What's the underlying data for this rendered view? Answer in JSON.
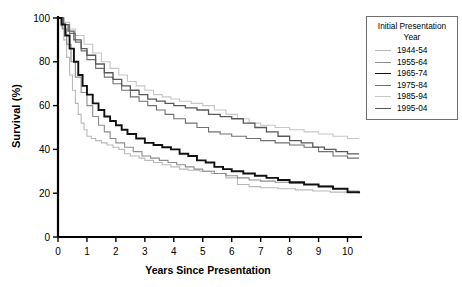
{
  "chart_data": {
    "type": "line",
    "title": "",
    "xlabel": "Years Since Presentation",
    "ylabel": "Survival (%)",
    "xlim": [
      0,
      10.5
    ],
    "ylim": [
      0,
      100
    ],
    "xticks": [
      "0",
      "1",
      "2",
      "3",
      "4",
      "5",
      "6",
      "7",
      "8",
      "9",
      "10"
    ],
    "yticks": [
      "0",
      "20",
      "40",
      "60",
      "80",
      "100"
    ],
    "grid": false,
    "legend_position": "right-outside",
    "legend_title": "Initial Presentation Year",
    "series": [
      {
        "name": "1944-54",
        "color": "#b9b9b9",
        "width": 1.1,
        "final_value": 27,
        "points": [
          [
            0,
            100
          ],
          [
            0.12,
            96
          ],
          [
            0.2,
            90
          ],
          [
            0.3,
            82
          ],
          [
            0.4,
            74
          ],
          [
            0.5,
            67
          ],
          [
            0.6,
            61
          ],
          [
            0.7,
            56
          ],
          [
            0.8,
            52
          ],
          [
            0.9,
            49
          ],
          [
            1.0,
            46
          ],
          [
            1.15,
            45
          ],
          [
            1.3,
            44
          ],
          [
            1.5,
            43
          ],
          [
            1.7,
            42
          ],
          [
            1.9,
            41
          ],
          [
            2.1,
            40
          ],
          [
            2.3,
            38
          ],
          [
            2.5,
            37
          ],
          [
            2.8,
            36
          ],
          [
            3.0,
            35
          ],
          [
            3.3,
            34
          ],
          [
            3.6,
            33
          ],
          [
            3.9,
            32
          ],
          [
            4.2,
            31
          ],
          [
            4.5,
            30.5
          ],
          [
            4.9,
            30
          ],
          [
            5.3,
            29
          ],
          [
            5.8,
            27
          ],
          [
            6.2,
            24
          ],
          [
            6.6,
            23
          ],
          [
            7.0,
            22.5
          ],
          [
            7.6,
            22
          ],
          [
            8.2,
            21.5
          ],
          [
            8.8,
            21
          ],
          [
            9.4,
            20.5
          ],
          [
            10.0,
            20
          ],
          [
            10.4,
            20
          ]
        ]
      },
      {
        "name": "1955-64",
        "color": "#8c8c8c",
        "width": 1.1,
        "final_value": 21,
        "points": [
          [
            0,
            100
          ],
          [
            0.15,
            95
          ],
          [
            0.3,
            88
          ],
          [
            0.45,
            80
          ],
          [
            0.6,
            73
          ],
          [
            0.8,
            66
          ],
          [
            1.0,
            60
          ],
          [
            1.2,
            55
          ],
          [
            1.4,
            51
          ],
          [
            1.6,
            48
          ],
          [
            1.8,
            45
          ],
          [
            2.0,
            43
          ],
          [
            2.3,
            41
          ],
          [
            2.6,
            39
          ],
          [
            2.9,
            37
          ],
          [
            3.2,
            36
          ],
          [
            3.5,
            35
          ],
          [
            3.8,
            34
          ],
          [
            4.1,
            33
          ],
          [
            4.4,
            32
          ],
          [
            4.7,
            31
          ],
          [
            5.0,
            30
          ],
          [
            5.4,
            29
          ],
          [
            5.8,
            28
          ],
          [
            6.2,
            27
          ],
          [
            6.6,
            26
          ],
          [
            7.0,
            25.5
          ],
          [
            7.5,
            25
          ],
          [
            8.0,
            24.5
          ],
          [
            8.5,
            24
          ],
          [
            9.0,
            23.5
          ],
          [
            9.5,
            22
          ],
          [
            10.0,
            21
          ],
          [
            10.4,
            21
          ]
        ]
      },
      {
        "name": "1965-74",
        "color": "#111111",
        "width": 1.9,
        "final_value": 20,
        "points": [
          [
            0,
            100
          ],
          [
            0.12,
            97
          ],
          [
            0.25,
            92
          ],
          [
            0.4,
            86
          ],
          [
            0.55,
            80
          ],
          [
            0.7,
            74
          ],
          [
            0.85,
            69
          ],
          [
            1.0,
            65
          ],
          [
            1.2,
            61
          ],
          [
            1.4,
            58
          ],
          [
            1.6,
            55
          ],
          [
            1.8,
            53
          ],
          [
            2.0,
            51
          ],
          [
            2.2,
            49
          ],
          [
            2.4,
            47
          ],
          [
            2.7,
            45
          ],
          [
            3.0,
            43
          ],
          [
            3.3,
            42
          ],
          [
            3.6,
            41
          ],
          [
            3.9,
            40
          ],
          [
            4.2,
            38
          ],
          [
            4.5,
            37
          ],
          [
            4.8,
            35
          ],
          [
            5.1,
            34
          ],
          [
            5.4,
            32
          ],
          [
            5.7,
            31
          ],
          [
            6.0,
            30
          ],
          [
            6.4,
            29
          ],
          [
            6.8,
            28
          ],
          [
            7.2,
            27
          ],
          [
            7.6,
            26
          ],
          [
            8.0,
            25
          ],
          [
            8.5,
            24
          ],
          [
            9.0,
            23
          ],
          [
            9.5,
            22
          ],
          [
            10.0,
            20.5
          ],
          [
            10.4,
            20
          ]
        ]
      },
      {
        "name": "1975-84",
        "color": "#707070",
        "width": 1.1,
        "final_value": 36,
        "points": [
          [
            0,
            100
          ],
          [
            0.2,
            97
          ],
          [
            0.4,
            93
          ],
          [
            0.6,
            89
          ],
          [
            0.8,
            85
          ],
          [
            1.0,
            81
          ],
          [
            1.3,
            77
          ],
          [
            1.6,
            73
          ],
          [
            1.9,
            70
          ],
          [
            2.2,
            67
          ],
          [
            2.5,
            64
          ],
          [
            2.8,
            62
          ],
          [
            3.1,
            60
          ],
          [
            3.4,
            58
          ],
          [
            3.7,
            56
          ],
          [
            4.0,
            54
          ],
          [
            4.4,
            52
          ],
          [
            4.8,
            50
          ],
          [
            5.2,
            48
          ],
          [
            5.6,
            47
          ],
          [
            6.0,
            46
          ],
          [
            6.5,
            45
          ],
          [
            7.0,
            44
          ],
          [
            7.5,
            43
          ],
          [
            8.0,
            42
          ],
          [
            8.5,
            41
          ],
          [
            9.0,
            39
          ],
          [
            9.5,
            37
          ],
          [
            10.0,
            36
          ],
          [
            10.4,
            36
          ]
        ]
      },
      {
        "name": "1985-94",
        "color": "#c6c6c6",
        "width": 1.1,
        "final_value": 45,
        "points": [
          [
            0,
            100
          ],
          [
            0.2,
            98
          ],
          [
            0.4,
            95
          ],
          [
            0.6,
            92
          ],
          [
            0.9,
            88
          ],
          [
            1.2,
            84
          ],
          [
            1.5,
            80
          ],
          [
            1.8,
            77
          ],
          [
            2.1,
            74
          ],
          [
            2.4,
            71
          ],
          [
            2.7,
            69
          ],
          [
            3.0,
            67
          ],
          [
            3.3,
            65
          ],
          [
            3.6,
            64
          ],
          [
            3.9,
            63
          ],
          [
            4.2,
            62
          ],
          [
            4.6,
            61
          ],
          [
            5.0,
            60
          ],
          [
            5.4,
            58
          ],
          [
            5.8,
            56
          ],
          [
            6.2,
            54
          ],
          [
            6.6,
            52
          ],
          [
            7.0,
            51
          ],
          [
            7.5,
            50
          ],
          [
            8.0,
            49
          ],
          [
            8.5,
            48
          ],
          [
            9.0,
            47
          ],
          [
            9.5,
            46
          ],
          [
            10.0,
            45
          ],
          [
            10.4,
            45
          ]
        ]
      },
      {
        "name": "1995-04",
        "color": "#595959",
        "width": 1.3,
        "final_value": 38,
        "points": [
          [
            0,
            100
          ],
          [
            0.18,
            97
          ],
          [
            0.35,
            94
          ],
          [
            0.55,
            90
          ],
          [
            0.8,
            86
          ],
          [
            1.0,
            83
          ],
          [
            1.3,
            79
          ],
          [
            1.6,
            75
          ],
          [
            1.9,
            72
          ],
          [
            2.2,
            69
          ],
          [
            2.5,
            67
          ],
          [
            2.8,
            65
          ],
          [
            3.1,
            63
          ],
          [
            3.4,
            62
          ],
          [
            3.7,
            61
          ],
          [
            4.0,
            60
          ],
          [
            4.4,
            59
          ],
          [
            4.8,
            58
          ],
          [
            5.2,
            56
          ],
          [
            5.6,
            55
          ],
          [
            6.0,
            54
          ],
          [
            6.4,
            52
          ],
          [
            6.8,
            50
          ],
          [
            7.2,
            48
          ],
          [
            7.6,
            46
          ],
          [
            8.0,
            44
          ],
          [
            8.4,
            43
          ],
          [
            8.8,
            41
          ],
          [
            9.2,
            40
          ],
          [
            9.6,
            39
          ],
          [
            10.0,
            38
          ],
          [
            10.4,
            38
          ]
        ]
      }
    ]
  }
}
